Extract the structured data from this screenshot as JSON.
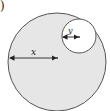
{
  "figure": {
    "label_fragment": ")",
    "outer_circle": {
      "cx": 57,
      "cy": 62,
      "r": 49,
      "fill": "#e6e6e6",
      "stroke": "#555555"
    },
    "inner_circle": {
      "cx": 79,
      "cy": 36,
      "r": 17,
      "fill": "#ffffff",
      "stroke": "#555555"
    },
    "arrow_x": {
      "label": "x",
      "x1": 9,
      "x2": 57,
      "y": 58
    },
    "arrow_y": {
      "label": "y",
      "x1": 62,
      "x2": 79,
      "y": 36
    }
  }
}
